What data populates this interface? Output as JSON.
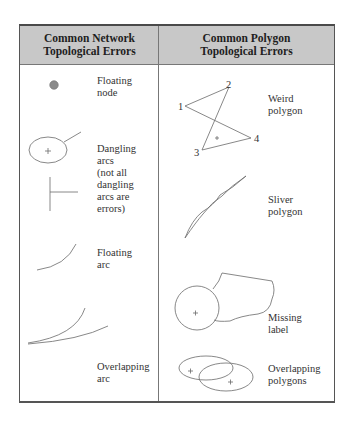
{
  "table": {
    "columns": [
      {
        "title_line1": "Common Network",
        "title_line2": "Topological Errors"
      },
      {
        "title_line1": "Common Polygon",
        "title_line2": "Topological Errors"
      }
    ]
  },
  "network_errors": [
    {
      "lines": [
        "Floating",
        "node"
      ]
    },
    {
      "lines": [
        "Dangling",
        "arcs",
        "(not all",
        "dangling",
        "arcs are",
        "errors)"
      ]
    },
    {
      "lines": [
        "Floating",
        "arc"
      ]
    },
    {
      "lines": [
        "Overlapping",
        "arc"
      ]
    }
  ],
  "polygon_errors": [
    {
      "lines": [
        "Weird",
        "polygon"
      ]
    },
    {
      "lines": [
        "Sliver",
        "polygon"
      ]
    },
    {
      "lines": [
        "Missing",
        "label"
      ]
    },
    {
      "lines": [
        "Overlapping",
        "polygons"
      ]
    }
  ],
  "weird_polygon_vertices": [
    "1",
    "2",
    "3",
    "4"
  ],
  "colors": {
    "header_bg": "#c8c8c8",
    "line": "#666666",
    "node": "#8a8a8a"
  }
}
